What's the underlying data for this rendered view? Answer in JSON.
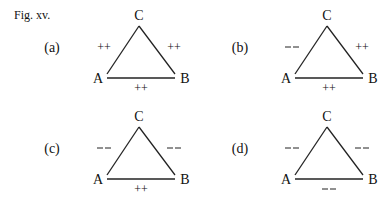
{
  "figure": {
    "label": "Fig. xv.",
    "panels": [
      {
        "id": "(a)",
        "vertices": {
          "top": "C",
          "left": "A",
          "right": "B"
        },
        "edges": {
          "AC": "++",
          "CB": "++",
          "AB": "++"
        }
      },
      {
        "id": "(b)",
        "vertices": {
          "top": "C",
          "left": "A",
          "right": "B"
        },
        "edges": {
          "AC": "—",
          "CB": "++",
          "AB": "++"
        }
      },
      {
        "id": "(c)",
        "vertices": {
          "top": "C",
          "left": "A",
          "right": "B"
        },
        "edges": {
          "AC": "—",
          "CB": "—",
          "AB": "++"
        }
      },
      {
        "id": "(d)",
        "vertices": {
          "top": "C",
          "left": "A",
          "right": "B"
        },
        "edges": {
          "AC": "—",
          "CB": "—",
          "AB": "—"
        }
      }
    ]
  }
}
